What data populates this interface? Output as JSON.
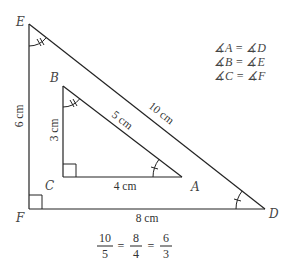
{
  "vertices": {
    "E": {
      "label": "E",
      "x": 29,
      "y": 24
    },
    "F": {
      "label": "F",
      "x": 29,
      "y": 209
    },
    "D": {
      "label": "D",
      "x": 265,
      "y": 209
    },
    "B": {
      "label": "B",
      "x": 63,
      "y": 86
    },
    "C": {
      "label": "C",
      "x": 63,
      "y": 177
    },
    "A": {
      "label": "A",
      "x": 182,
      "y": 177
    }
  },
  "measurements": {
    "EF": "6 cm",
    "FD": "8 cm",
    "ED": "10 cm",
    "BC": "3 cm",
    "CA": "4 cm",
    "BA": "5 cm"
  },
  "angle_equalities": [
    "∡A = ∡D",
    "∡B = ∡E",
    "∡C = ∡F"
  ],
  "ratio_equation": {
    "fractions": [
      {
        "numerator": "10",
        "denominator": "5"
      },
      {
        "numerator": "8",
        "denominator": "4"
      },
      {
        "numerator": "6",
        "denominator": "3"
      }
    ],
    "operator": "="
  },
  "colors": {
    "stroke": "#222222",
    "text": "#444444",
    "background": "#ffffff"
  }
}
